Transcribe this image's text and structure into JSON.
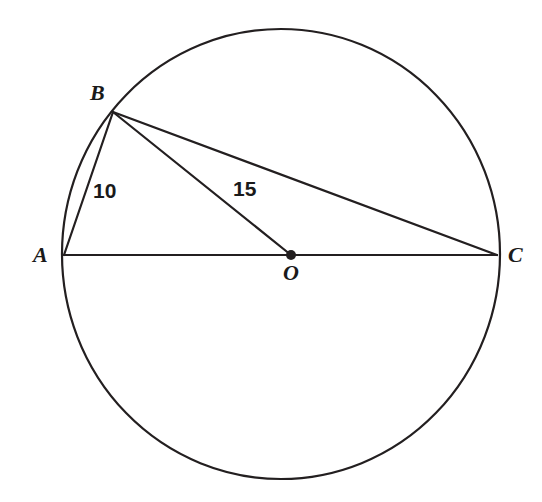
{
  "figure": {
    "background_color": "#ffffff",
    "stroke_color": "#231f20",
    "text_color": "#1a1a1a",
    "width": 542,
    "height": 502
  },
  "circle": {
    "name": "circle-O",
    "center_x": 281,
    "center_y": 254,
    "radius_x": 219,
    "radius_y": 225,
    "stroke_width": 2.2
  },
  "points": [
    {
      "id": "A",
      "label": "A",
      "x": 64,
      "y": 255,
      "on_circle": true,
      "is_center": false,
      "dot": false
    },
    {
      "id": "B",
      "label": "B",
      "x": 113,
      "y": 112,
      "on_circle": true,
      "is_center": false,
      "dot": false
    },
    {
      "id": "C",
      "label": "C",
      "x": 497,
      "y": 255,
      "on_circle": true,
      "is_center": false,
      "dot": false
    },
    {
      "id": "O",
      "label": "O",
      "x": 291,
      "y": 255,
      "on_circle": false,
      "is_center": true,
      "dot": true,
      "dot_radius": 5
    }
  ],
  "segments": [
    {
      "id": "AC",
      "from": "A",
      "to": "C",
      "x1": 64,
      "y1": 255,
      "x2": 497,
      "y2": 255,
      "kind": "diameter"
    },
    {
      "id": "AB",
      "from": "A",
      "to": "B",
      "x1": 64,
      "y1": 255,
      "x2": 113,
      "y2": 112,
      "kind": "chord"
    },
    {
      "id": "BO",
      "from": "B",
      "to": "O",
      "x1": 113,
      "y1": 112,
      "x2": 291,
      "y2": 255,
      "kind": "cevian"
    },
    {
      "id": "BC",
      "from": "B",
      "to": "C",
      "x1": 113,
      "y1": 112,
      "x2": 497,
      "y2": 255,
      "kind": "chord"
    }
  ],
  "measurements": [
    {
      "id": "len-AB",
      "segment": "AB",
      "value": "10",
      "x": 93,
      "y": 180
    },
    {
      "id": "len-BO",
      "segment": "BO",
      "value": "15",
      "x": 233,
      "y": 178
    }
  ],
  "labels": {
    "A": "A",
    "B": "B",
    "C": "C",
    "O": "O"
  },
  "chart_data": {
    "type": "diagram",
    "shapes": [
      {
        "shape": "circle",
        "center": [
          281,
          254
        ],
        "radius": [
          219,
          225
        ],
        "label": "circle centered at O"
      },
      {
        "shape": "line",
        "points": [
          [
            64,
            255
          ],
          [
            497,
            255
          ]
        ],
        "label": "AC (diameter)"
      },
      {
        "shape": "line",
        "points": [
          [
            64,
            255
          ],
          [
            113,
            112
          ]
        ],
        "label": "AB = 10"
      },
      {
        "shape": "line",
        "points": [
          [
            113,
            112
          ],
          [
            291,
            255
          ]
        ],
        "label": "BO = 15"
      },
      {
        "shape": "line",
        "points": [
          [
            113,
            112
          ],
          [
            497,
            255
          ]
        ],
        "label": "BC"
      },
      {
        "shape": "point",
        "at": [
          291,
          255
        ],
        "label": "O (center)"
      }
    ],
    "annotations": [
      "A",
      "B",
      "C",
      "O",
      "10",
      "15"
    ]
  }
}
